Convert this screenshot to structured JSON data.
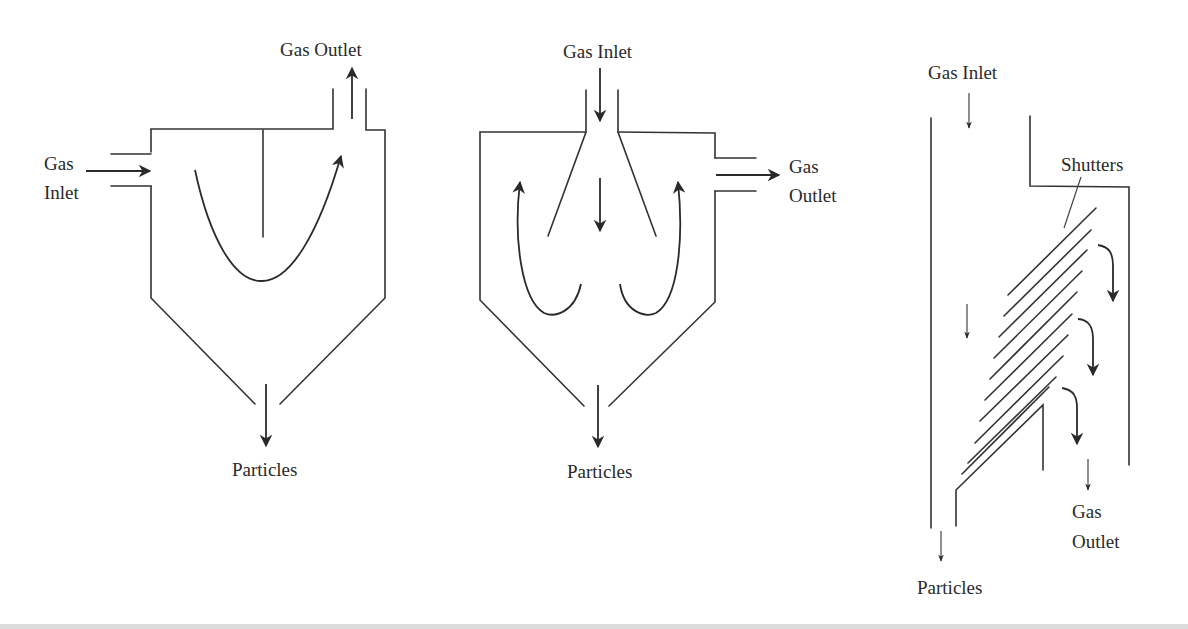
{
  "diagram": {
    "figures": [
      {
        "id": "tangential-inlet-separator",
        "labels": {
          "gas_outlet": "Gas Outlet",
          "gas_inlet_line1": "Gas",
          "gas_inlet_line2": "Inlet",
          "particles": "Particles"
        }
      },
      {
        "id": "top-inlet-separator",
        "labels": {
          "gas_inlet": "Gas Inlet",
          "gas_outlet_line1": "Gas",
          "gas_outlet_line2": "Outlet",
          "particles": "Particles"
        }
      },
      {
        "id": "shutter-separator",
        "labels": {
          "gas_inlet": "Gas Inlet",
          "shutters": "Shutters",
          "gas_outlet_line1": "Gas",
          "gas_outlet_line2": "Outlet",
          "particles": "Particles"
        },
        "shutter_count": 10
      }
    ],
    "colors": {
      "line": "#333333",
      "text": "#2a2a2a",
      "background": "#ffffff"
    }
  }
}
